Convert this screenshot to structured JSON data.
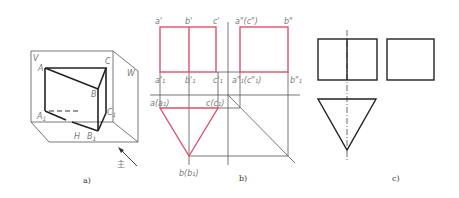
{
  "figure": {
    "panel_a": {
      "caption": "a)",
      "plane_labels": {
        "v": "V",
        "h": "H",
        "w": "W"
      },
      "vertex_labels": {
        "a": "A",
        "b": "B",
        "c": "C",
        "a1": "A",
        "a1_sub": "1",
        "b1": "B",
        "b1_sub": "1",
        "c1": "C",
        "c1_sub": "1"
      },
      "view_direction": "主"
    },
    "panel_b": {
      "caption": "b)",
      "front_top_labels": [
        "a'",
        "b'",
        "c'"
      ],
      "front_bottom_labels": [
        "a'₁",
        "b'₁",
        "c'₁"
      ],
      "side_top_labels": [
        "a\"(c\")",
        "b\""
      ],
      "side_bottom_labels": [
        "a\"₁(c\"₁)",
        "b\"₁"
      ],
      "top_view_labels": {
        "left": "a(a₁)",
        "right": "c(c₁)",
        "bottom": "b(b₁)"
      },
      "highlight_color": "#e0506a"
    },
    "panel_c": {
      "caption": "c)",
      "line_color": "#222222"
    }
  }
}
